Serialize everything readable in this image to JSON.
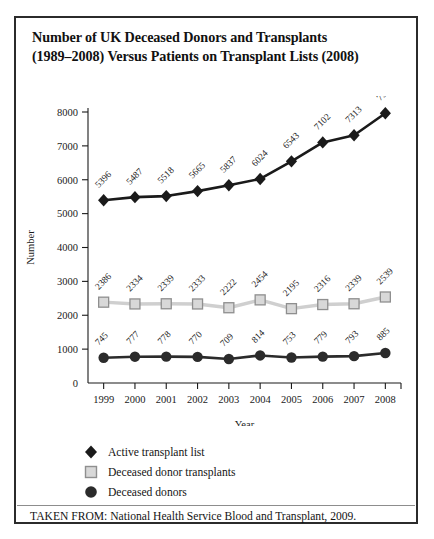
{
  "figure": {
    "title_line1": "Number of UK Deceased Donors and Transplants",
    "title_line2": "(1989–2008) Versus Patients on Transplant Lists (2008)",
    "source_note": "TAKEN FROM: National Health Service Blood and Transplant, 2009."
  },
  "legend": {
    "items": [
      {
        "label": "Active transplant list",
        "marker": "diamond-marker-icon",
        "color": "#1a1a1a"
      },
      {
        "label": "Deceased donor transplants",
        "marker": "square-marker-icon",
        "color": "#b9b9b9"
      },
      {
        "label": "Deceased donors",
        "marker": "circle-marker-icon",
        "color": "#2b2b2b"
      }
    ]
  },
  "chart_data": {
    "type": "line",
    "title": "Number of UK Deceased Donors and Transplants (1989–2008) Versus Patients on Transplant Lists (2008)",
    "xlabel": "Year",
    "ylabel": "Number",
    "categories": [
      "1999",
      "2000",
      "2001",
      "2002",
      "2003",
      "2004",
      "2005",
      "2006",
      "2007",
      "2008"
    ],
    "x": [
      1999,
      2000,
      2001,
      2002,
      2003,
      2004,
      2005,
      2006,
      2007,
      2008
    ],
    "ylim": [
      0,
      8000
    ],
    "yticks": [
      0,
      1000,
      2000,
      3000,
      4000,
      5000,
      6000,
      7000,
      8000
    ],
    "ytick_labels": [
      "0",
      "1000",
      "2000",
      "3000",
      "4000",
      "5000",
      "6000",
      "7000",
      "8000"
    ],
    "grid": false,
    "legend_position": "below-plot-left",
    "data_labels": true,
    "data_label_rotation": -45,
    "series": [
      {
        "name": "Active transplant list",
        "marker": "diamond",
        "color": "#1a1a1a",
        "line_color": "#1a1a1a",
        "values": [
          5396,
          5487,
          5518,
          5665,
          5837,
          6024,
          6543,
          7102,
          7313,
          7963
        ]
      },
      {
        "name": "Deceased donor transplants",
        "marker": "square",
        "color": "#b9b9b9",
        "line_color": "#cfcfcf",
        "values": [
          2386,
          2334,
          2339,
          2333,
          2222,
          2454,
          2195,
          2316,
          2339,
          2539
        ]
      },
      {
        "name": "Deceased donors",
        "marker": "circle",
        "color": "#2b2b2b",
        "line_color": "#2b2b2b",
        "values": [
          745,
          777,
          778,
          770,
          709,
          814,
          753,
          779,
          793,
          885
        ]
      }
    ]
  }
}
